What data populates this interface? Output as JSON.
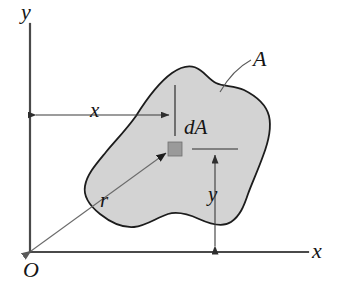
{
  "figure": {
    "canvas": {
      "width": 356,
      "height": 305,
      "background": "#ffffff"
    },
    "colors": {
      "area_fill": "#d3d3d3",
      "area_outline": "#1c1c1c",
      "axis": "#4a4a4a",
      "dimension": "#3a3a3a",
      "da_fill": "#9a9a9a",
      "text": "#151515"
    },
    "axes": {
      "y_axis_label": "y",
      "x_axis_label": "x",
      "origin_label": "O",
      "y_axis": {
        "x": 30,
        "y_top": 24,
        "y_bottom": 252
      },
      "x_axis": {
        "y": 252,
        "x_left": 30,
        "x_right": 308
      }
    },
    "labels": {
      "area": "A",
      "element": "dA",
      "x_distance": "x",
      "y_distance": "y",
      "radius": "r"
    },
    "elements": {
      "da_square": {
        "x": 168,
        "y": 142,
        "size": 14
      },
      "x_dimension": {
        "from_x": 30,
        "to_x": 175,
        "y": 115
      },
      "y_dimension": {
        "x": 215,
        "from_y": 149,
        "to_y": 252
      },
      "radius_vector": {
        "from_x": 31,
        "from_y": 251,
        "to_x": 170,
        "to_y": 150
      },
      "area_leader": {
        "from_x": 220,
        "from_y": 92,
        "to_x": 251,
        "to_y": 60
      }
    }
  }
}
